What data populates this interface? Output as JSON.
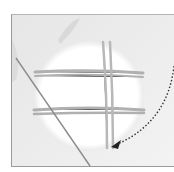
{
  "illustration": {
    "subject": "needle weaving threads across a circular ring",
    "colors": {
      "background": "#ebebeb",
      "ring_fill": "#ffffff",
      "thread": "#b3b3b3",
      "needle": "#8c8c8c",
      "arrow": "#333333",
      "frame_border": "#9a9a9a"
    },
    "icons": [
      "dotted-curved-arrow-icon"
    ]
  }
}
